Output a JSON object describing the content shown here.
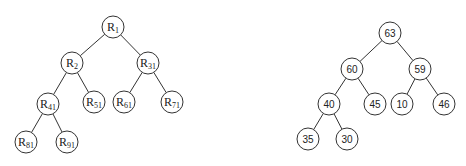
{
  "diagram": {
    "type": "binary-tree-pair",
    "left_tree": {
      "name": "R-labels",
      "nodes": [
        {
          "id": "R1",
          "base": "R",
          "sub": "1",
          "x": 113,
          "y": 27
        },
        {
          "id": "R2",
          "base": "R",
          "sub": "2",
          "x": 72,
          "y": 63
        },
        {
          "id": "R31",
          "base": "R",
          "sub": "31",
          "x": 148,
          "y": 63
        },
        {
          "id": "R41",
          "base": "R",
          "sub": "41",
          "x": 48,
          "y": 104
        },
        {
          "id": "R51",
          "base": "R",
          "sub": "51",
          "x": 94,
          "y": 102
        },
        {
          "id": "R61",
          "base": "R",
          "sub": "61",
          "x": 124,
          "y": 102
        },
        {
          "id": "R71",
          "base": "R",
          "sub": "71",
          "x": 172,
          "y": 102
        },
        {
          "id": "R81",
          "base": "R",
          "sub": "81",
          "x": 26,
          "y": 142
        },
        {
          "id": "R91",
          "base": "R",
          "sub": "91",
          "x": 67,
          "y": 142
        }
      ],
      "edges": [
        [
          "R1",
          "R2"
        ],
        [
          "R1",
          "R31"
        ],
        [
          "R2",
          "R41"
        ],
        [
          "R2",
          "R51"
        ],
        [
          "R31",
          "R61"
        ],
        [
          "R31",
          "R71"
        ],
        [
          "R41",
          "R81"
        ],
        [
          "R41",
          "R91"
        ]
      ]
    },
    "right_tree": {
      "name": "values",
      "nodes": [
        {
          "id": "n63",
          "label": "63",
          "x": 390,
          "y": 33
        },
        {
          "id": "n60",
          "label": "60",
          "x": 352,
          "y": 69
        },
        {
          "id": "n59",
          "label": "59",
          "x": 420,
          "y": 69
        },
        {
          "id": "n40",
          "label": "40",
          "x": 329,
          "y": 104
        },
        {
          "id": "n45",
          "label": "45",
          "x": 375,
          "y": 104
        },
        {
          "id": "n10",
          "label": "10",
          "x": 402,
          "y": 104
        },
        {
          "id": "n46",
          "label": "46",
          "x": 444,
          "y": 104
        },
        {
          "id": "n35",
          "label": "35",
          "x": 308,
          "y": 139
        },
        {
          "id": "n30",
          "label": "30",
          "x": 347,
          "y": 139
        }
      ],
      "edges": [
        [
          "n63",
          "n60"
        ],
        [
          "n63",
          "n59"
        ],
        [
          "n60",
          "n40"
        ],
        [
          "n60",
          "n45"
        ],
        [
          "n59",
          "n10"
        ],
        [
          "n59",
          "n46"
        ],
        [
          "n40",
          "n35"
        ],
        [
          "n40",
          "n30"
        ]
      ]
    },
    "node_radius": 11,
    "colors": {
      "stroke": "#333333",
      "fill": "#ffffff",
      "text": "#222222"
    }
  }
}
